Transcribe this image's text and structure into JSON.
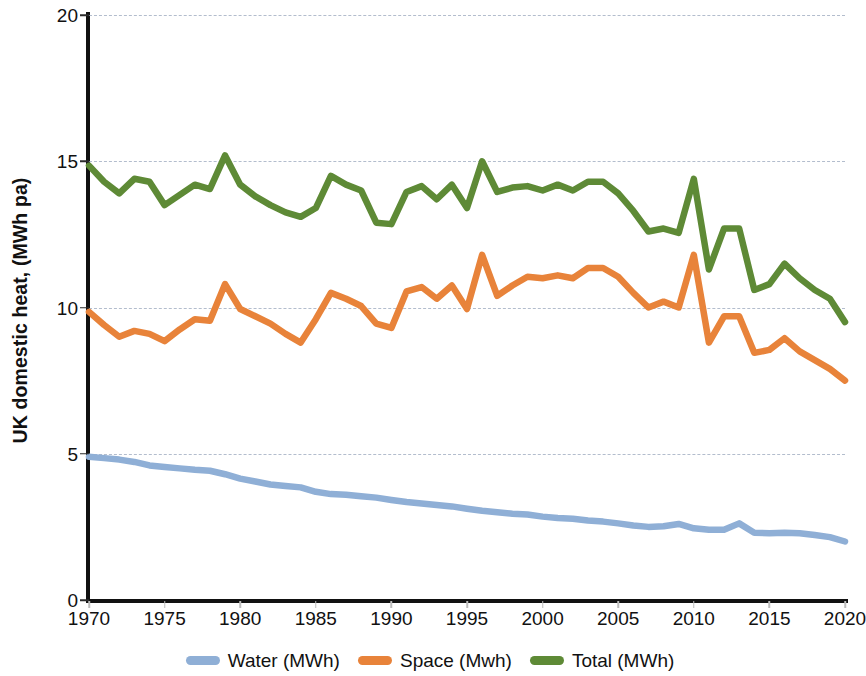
{
  "chart_data": {
    "type": "line",
    "title": "",
    "xlabel": "",
    "ylabel": "UK domestic heat, (MWh pa)",
    "xlim": [
      1970,
      2020
    ],
    "ylim": [
      0,
      20
    ],
    "ytick_labels": [
      "0",
      "5",
      "10",
      "15",
      "20"
    ],
    "ytick_values": [
      0,
      5,
      10,
      15,
      20
    ],
    "xtick_labels": [
      "1970",
      "1975",
      "1980",
      "1985",
      "1990",
      "1995",
      "2000",
      "2005",
      "2010",
      "2015",
      "2020"
    ],
    "xtick_values": [
      1970,
      1975,
      1980,
      1985,
      1990,
      1995,
      2000,
      2005,
      2010,
      2015,
      2020
    ],
    "grid": "horizontal-dashed",
    "legend_position": "bottom-center",
    "x": [
      1970,
      1971,
      1972,
      1973,
      1974,
      1975,
      1976,
      1977,
      1978,
      1979,
      1980,
      1981,
      1982,
      1983,
      1984,
      1985,
      1986,
      1987,
      1988,
      1989,
      1990,
      1991,
      1992,
      1993,
      1994,
      1995,
      1996,
      1997,
      1998,
      1999,
      2000,
      2001,
      2002,
      2003,
      2004,
      2005,
      2006,
      2007,
      2008,
      2009,
      2010,
      2011,
      2012,
      2013,
      2014,
      2015,
      2016,
      2017,
      2018,
      2019,
      2020
    ],
    "series": [
      {
        "name": "Water (MWh)",
        "color": "#8FAFD6",
        "values": [
          4.9,
          4.85,
          4.8,
          4.72,
          4.6,
          4.55,
          4.5,
          4.45,
          4.42,
          4.3,
          4.15,
          4.05,
          3.95,
          3.9,
          3.85,
          3.7,
          3.62,
          3.6,
          3.55,
          3.5,
          3.42,
          3.35,
          3.3,
          3.25,
          3.2,
          3.12,
          3.05,
          3.0,
          2.95,
          2.92,
          2.85,
          2.8,
          2.78,
          2.72,
          2.68,
          2.62,
          2.55,
          2.5,
          2.52,
          2.6,
          2.45,
          2.4,
          2.4,
          2.62,
          2.3,
          2.28,
          2.3,
          2.28,
          2.22,
          2.15,
          2.0
        ]
      },
      {
        "name": "Space (Mwh)",
        "color": "#E8833A",
        "values": [
          9.85,
          9.4,
          9.0,
          9.2,
          9.1,
          8.85,
          9.25,
          9.6,
          9.55,
          10.8,
          9.95,
          9.7,
          9.45,
          9.1,
          8.8,
          9.6,
          10.5,
          10.3,
          10.05,
          9.45,
          9.3,
          10.55,
          10.7,
          10.3,
          10.75,
          9.95,
          11.8,
          10.4,
          10.75,
          11.05,
          11.0,
          11.1,
          11.0,
          11.35,
          11.35,
          11.05,
          10.5,
          10.0,
          10.2,
          10.0,
          11.8,
          8.8,
          9.7,
          9.7,
          8.45,
          8.55,
          8.95,
          8.5,
          8.2,
          7.9,
          7.5
        ]
      },
      {
        "name": "Total (MWh)",
        "color": "#5E8A36",
        "values": [
          14.85,
          14.3,
          13.9,
          14.4,
          14.3,
          13.5,
          13.85,
          14.2,
          14.05,
          15.2,
          14.2,
          13.8,
          13.5,
          13.25,
          13.1,
          13.4,
          14.5,
          14.2,
          14.0,
          12.9,
          12.85,
          13.95,
          14.15,
          13.7,
          14.2,
          13.4,
          15.0,
          13.95,
          14.1,
          14.15,
          14.0,
          14.2,
          14.0,
          14.3,
          14.3,
          13.9,
          13.3,
          12.6,
          12.7,
          12.55,
          14.4,
          11.3,
          12.7,
          12.7,
          10.6,
          10.8,
          11.5,
          11.0,
          10.6,
          10.3,
          9.5
        ]
      }
    ]
  },
  "legend": {
    "items": [
      {
        "label": "Water (MWh)",
        "color": "#8FAFD6"
      },
      {
        "label": "Space (Mwh)",
        "color": "#E8833A"
      },
      {
        "label": "Total (MWh)",
        "color": "#5E8A36"
      }
    ]
  },
  "axes": {
    "y_title": "UK domestic heat, (MWh pa)"
  }
}
